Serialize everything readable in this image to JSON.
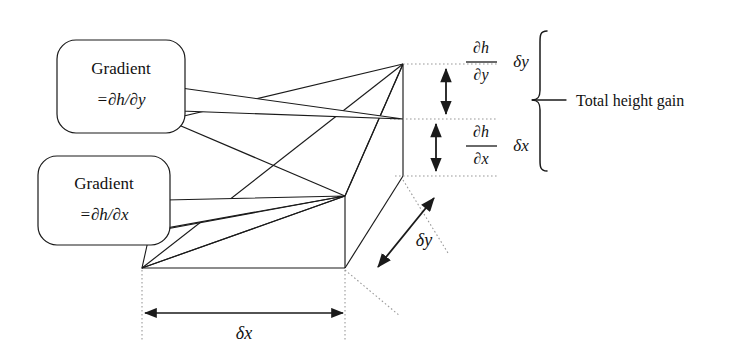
{
  "diagram": {
    "stroke_color": "#1a1a1a",
    "dotted_color": "#9a9a9a",
    "background": "#ffffff"
  },
  "callouts": [
    {
      "id": "gradient-dy",
      "line1": "Gradient",
      "line2_prefix": "=",
      "line2_numerator": "∂h",
      "line2_slash": "/",
      "line2_denominator": "∂y",
      "line2_full": "=∂h/∂y"
    },
    {
      "id": "gradient-dx",
      "line1": "Gradient",
      "line2_prefix": "=",
      "line2_numerator": "∂h",
      "line2_slash": "/",
      "line2_denominator": "∂x",
      "line2_full": "=∂h/∂x"
    }
  ],
  "height_components": [
    {
      "id": "component-dy",
      "numerator": "∂h",
      "denominator": "∂y",
      "multiplier": "δy"
    },
    {
      "id": "component-dx",
      "numerator": "∂h",
      "denominator": "∂x",
      "multiplier": "δx"
    }
  ],
  "brace_label": "Total height gain",
  "dimension_labels": {
    "x_extent": "δx",
    "y_extent": "δy"
  }
}
